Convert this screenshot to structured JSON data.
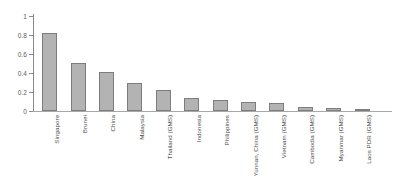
{
  "chart_data": {
    "type": "bar",
    "title": "",
    "xlabel": "",
    "ylabel": "",
    "ylim": [
      0,
      1
    ],
    "yticks": [
      0,
      0.2,
      0.4,
      0.6,
      0.8,
      1
    ],
    "ytick_labels": [
      "0",
      "0.2",
      "0.4",
      "0.6",
      "0.8",
      "1"
    ],
    "grid": false,
    "legend": false,
    "bar_color": "#b3b3b3",
    "bar_edge_color": "#7d7d7d",
    "axis_color": "#8a8a8a",
    "categories": [
      "Singapore",
      "Brunei",
      "China",
      "Malaysia",
      "Thailand (GMS)",
      "Indonesia",
      "Philippines",
      "Yunnan, China (GMS)",
      "Vietnam (GMS)",
      "Cambodia (GMS)",
      "Myanmar (GMS)",
      "Laos PDR (GMS)"
    ],
    "values": [
      0.82,
      0.51,
      0.41,
      0.3,
      0.22,
      0.14,
      0.12,
      0.09,
      0.085,
      0.04,
      0.03,
      0.005
    ]
  }
}
